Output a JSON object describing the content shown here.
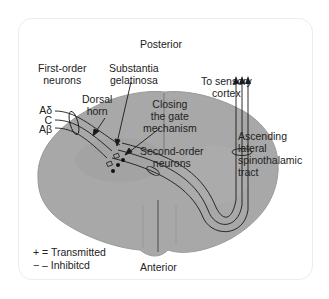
{
  "figure": {
    "colors": {
      "cord_fill": "#a8a8a8",
      "cord_shade": "#9a9a9a",
      "line": "#1a1a1a",
      "text": "#222222",
      "frame_border": "#ececec"
    }
  },
  "labels": {
    "posterior": "Posterior",
    "anterior": "Anterior",
    "first_order_neurons": "First-order\nneurons",
    "substantia_gelatinosa": "Substantia\ngelatinosa",
    "dorsal_horn": "Dorsal\nhorn",
    "closing_gate": "Closing\nthe gate\nmechanism",
    "second_order_neurons": "Second-order\nneurons",
    "to_sensory_cortex": "To sensory\ncortex",
    "ascending_tract": "Ascending\nlateral\nspinothalamic\ntract"
  },
  "fibers": [
    {
      "label": "Aδ"
    },
    {
      "label": "C"
    },
    {
      "label": "Aβ"
    }
  ],
  "legend": {
    "items": [
      {
        "symbol": "+",
        "text": "+ = Transmitted"
      },
      {
        "symbol": "−",
        "text": "− – Inhibitcd"
      }
    ]
  }
}
